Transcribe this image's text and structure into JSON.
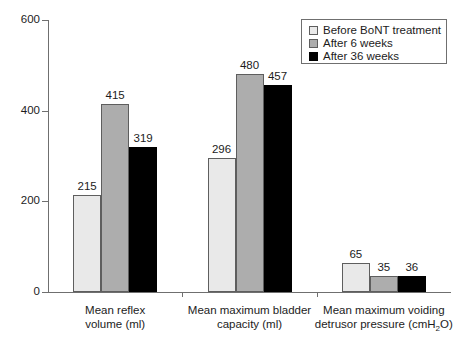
{
  "chart_data": {
    "type": "bar",
    "title": "",
    "subtitle": "",
    "xlabel": "",
    "ylabel": "",
    "ylim": [
      0,
      600
    ],
    "yticks": [
      0,
      200,
      400,
      600
    ],
    "grid": false,
    "legend_position": "top-right",
    "categories": [
      "Mean reflex volume (ml)",
      "Mean maximum bladder capacity (ml)",
      "Mean maximum voiding detrusor pressure (cmH2O)"
    ],
    "category_lines": [
      [
        "Mean reflex",
        "volume (ml)"
      ],
      [
        "Mean maximum bladder",
        "capacity (ml)"
      ],
      [
        "Mean maximum voiding",
        "detrusor pressure (cmH₂O)"
      ]
    ],
    "series": [
      {
        "name": "Before BoNT treatment",
        "color": "#e9e9e9",
        "values": [
          215,
          296,
          65
        ]
      },
      {
        "name": "After 6 weeks",
        "color": "#adadad",
        "values": [
          415,
          480,
          35
        ]
      },
      {
        "name": "After 36 weeks",
        "color": "#000000",
        "values": [
          319,
          457,
          36
        ]
      }
    ],
    "value_labels": [
      [
        "215",
        "415",
        "319"
      ],
      [
        "296",
        "480",
        "457"
      ],
      [
        "65",
        "35",
        "36"
      ]
    ],
    "ytick_labels": [
      "0",
      "200",
      "400",
      "600"
    ]
  },
  "legend": {
    "items": [
      {
        "label": "Before BoNT treatment",
        "swatch": "light-gray"
      },
      {
        "label": "After 6 weeks",
        "swatch": "medium-gray"
      },
      {
        "label": "After 36 weeks",
        "swatch": "black"
      }
    ]
  },
  "colors": {
    "series_before": "#e9e9e9",
    "series_6weeks": "#adadad",
    "series_36weeks": "#000000",
    "axis": "#6f6f6f",
    "text": "#1c1c1c",
    "background": "#ffffff"
  }
}
